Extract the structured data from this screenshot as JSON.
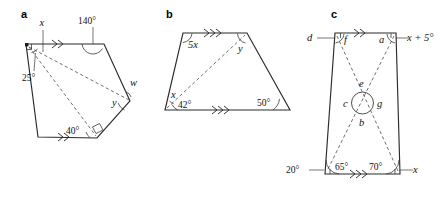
{
  "figure": {
    "panels": [
      {
        "letter": "a",
        "shape": "pentagon",
        "labels": {
          "vertex_top_left_var": "x",
          "interior_25": "25°",
          "top_angle": "140°",
          "right_outer_var": "w",
          "right_inner_var": "y",
          "bottom_angle": "40°"
        },
        "marks": {
          "parallel_top": "double-chevron",
          "parallel_bottom": "double-chevron",
          "right_angle_top_left": true,
          "right_angle_bottom_right": true
        }
      },
      {
        "letter": "b",
        "shape": "trapezium",
        "labels": {
          "top_left_angle": "5x",
          "top_right_angle": "y",
          "bottom_left_upper": "x",
          "bottom_left_lower": "42°",
          "bottom_right_angle": "50°"
        },
        "marks": {
          "parallel_top": "triple-chevron",
          "parallel_bottom": "triple-chevron"
        }
      },
      {
        "letter": "c",
        "shape": "trapezium-with-diagonals",
        "labels": {
          "top_left_outer": "d",
          "top_left_inner": "f",
          "top_right_inner": "a",
          "top_right_outer": "x + 5°",
          "centre_top": "e",
          "centre_left": "c",
          "centre_right": "g",
          "centre_bottom": "b",
          "bottom_left_outer": "20°",
          "bottom_left_inner": "65°",
          "bottom_right_inner": "70°",
          "bottom_right_outer": "x"
        },
        "marks": {
          "parallel_top": "double-chevron",
          "parallel_bottom": "triple-chevron",
          "centre_circle": true
        }
      }
    ]
  },
  "colors": {
    "solid_stroke": "#2b2b2b",
    "dashed_stroke": "#555555",
    "text": "#111111",
    "background": "#ffffff"
  }
}
